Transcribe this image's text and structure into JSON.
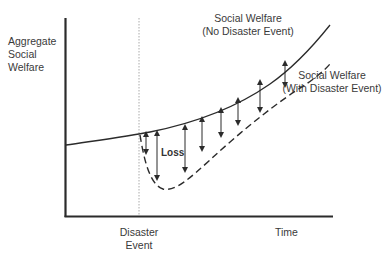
{
  "diagram": {
    "y_axis_label": [
      "Aggregate",
      "Social",
      "Welfare"
    ],
    "x_axis_label": "Time",
    "event_marker_label": [
      "Disaster",
      "Event"
    ],
    "curve_no_disaster_label": [
      "Social Welfare",
      "(No Disaster Event)"
    ],
    "curve_with_disaster_label": [
      "Social Welfare",
      "(With Disaster Event)"
    ],
    "gap_label": "Loss",
    "colors": {
      "line": "#2b2b2b",
      "text": "#3a3a3a",
      "marker": "#999999",
      "background": "#ffffff"
    }
  }
}
